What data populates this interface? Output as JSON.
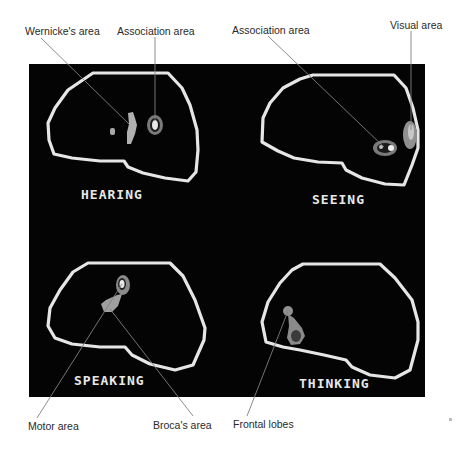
{
  "figure": {
    "callouts_top": {
      "wernicke": "Wernicke's area",
      "association_hearing": "Association area",
      "association_seeing": "Association area",
      "visual": "Visual area"
    },
    "callouts_bottom": {
      "motor": "Motor area",
      "broca": "Broca's area",
      "frontal": "Frontal lobes"
    },
    "scans": [
      {
        "id": "hearing",
        "label": "HEARING"
      },
      {
        "id": "seeing",
        "label": "SEEING"
      },
      {
        "id": "speaking",
        "label": "SPEAKING"
      },
      {
        "id": "thinking",
        "label": "THINKING"
      }
    ],
    "colors": {
      "background": "#040404",
      "outline": "#e6e6e6",
      "activity": "#b8b8b8",
      "leader_line": "#808080",
      "label_text": "#2a2a2a"
    }
  }
}
